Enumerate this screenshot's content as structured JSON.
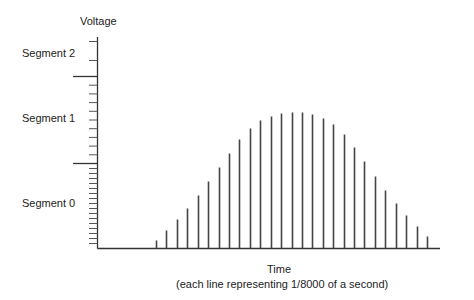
{
  "chart_data": {
    "type": "bar",
    "title": "",
    "ylabel": "Voltage",
    "xlabel": "Time",
    "xlabel_note": "(each line representing 1/8000 of a second)",
    "segments": [
      {
        "name": "Segment 2",
        "tick_count": 2
      },
      {
        "name": "Segment 1",
        "tick_count": 9
      },
      {
        "name": "Segment 0",
        "tick_count": 16
      }
    ],
    "grid": false,
    "legend": null,
    "sample_heights_px": [
      8,
      18,
      29,
      40,
      53,
      67,
      81,
      95,
      109,
      120,
      128,
      132,
      135,
      136,
      136,
      134,
      130,
      124,
      114,
      101,
      87,
      72,
      58,
      45,
      33,
      22,
      12
    ],
    "colors": {
      "axis": "#333333",
      "bar": "#444444",
      "tick": "#555555"
    }
  },
  "labels": {
    "voltage": "Voltage",
    "segment2": "Segment 2",
    "segment1": "Segment 1",
    "segment0": "Segment 0",
    "time": "Time",
    "time_note": "(each line representing 1/8000 of a second)"
  }
}
